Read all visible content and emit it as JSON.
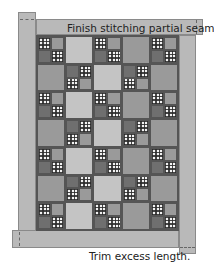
{
  "annotations": {
    "top": "Finish stitching partial seam.",
    "bottom": "Trim excess length."
  },
  "colors": {
    "border_strip": "#b9b9b9",
    "outline": "#555555",
    "dark": "#6f6f6f",
    "medium": "#9a9a9a",
    "light": "#c4c4c4",
    "checker_light": "#f2f2f2",
    "checker_dark": "#282828"
  },
  "quilt": {
    "columns": 5,
    "rows": 7,
    "layout": [
      [
        "four-patch",
        "plain-light",
        "four-patch",
        "plain-medium",
        "four-patch"
      ],
      [
        "plain-medium",
        "four-patch-flipped",
        "plain-light",
        "four-patch-flipped",
        "plain-medium"
      ],
      [
        "four-patch",
        "plain-light",
        "four-patch",
        "plain-medium",
        "four-patch"
      ],
      [
        "plain-medium",
        "four-patch-flipped",
        "plain-light",
        "four-patch-flipped",
        "plain-medium"
      ],
      [
        "four-patch",
        "plain-light",
        "four-patch",
        "plain-medium",
        "four-patch"
      ],
      [
        "plain-medium",
        "four-patch-flipped",
        "plain-light",
        "four-patch-flipped",
        "plain-medium"
      ],
      [
        "four-patch",
        "plain-light",
        "four-patch",
        "plain-medium",
        "four-patch"
      ]
    ],
    "borders": [
      "left",
      "top",
      "right",
      "bottom"
    ]
  }
}
